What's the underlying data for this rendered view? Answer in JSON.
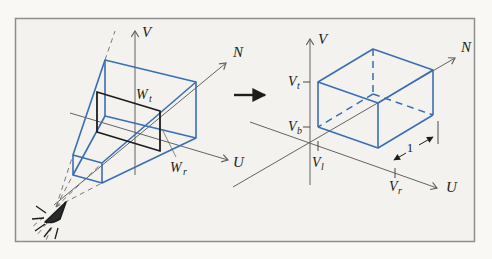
{
  "left_figure": {
    "axis_v": "V",
    "axis_n": "N",
    "axis_u": "U",
    "label_wt_main": "W",
    "label_wt_sub": "t",
    "label_wr_main": "W",
    "label_wr_sub": "r"
  },
  "right_figure": {
    "axis_v": "V",
    "axis_n": "N",
    "axis_u": "U",
    "label_vt_main": "V",
    "label_vt_sub": "t",
    "label_vb_main": "V",
    "label_vb_sub": "b",
    "label_vl_main": "V",
    "label_vl_sub": "l",
    "label_vr_main": "V",
    "label_vr_sub": "r",
    "depth_dimension": "1"
  },
  "colors": {
    "volume_blue": "#3a6eb5",
    "axis_gray": "#636363",
    "ink_black": "#1d1d1d",
    "panel_background": "#f3f2ee",
    "frame_border": "#8e8e8e",
    "page_background": "#f9f8f5"
  }
}
